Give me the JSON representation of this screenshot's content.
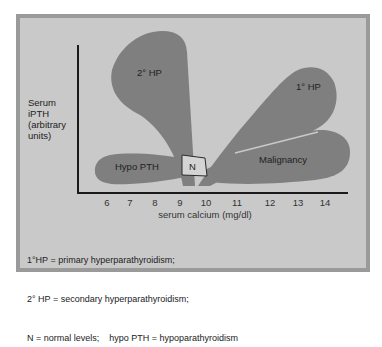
{
  "diagram": {
    "y_axis_label": [
      "Serum",
      "iPTH",
      "(arbitrary",
      "units)"
    ],
    "x_axis_label": "serum calcium (mg/dl)",
    "x_ticks": [
      "6",
      "7",
      "8",
      "9",
      "10",
      "11",
      "12",
      "13",
      "14"
    ],
    "regions": [
      {
        "id": "secondary_hp",
        "label": "2° HP"
      },
      {
        "id": "primary_hp",
        "label": "1° HP"
      },
      {
        "id": "malignancy",
        "label": "Malignancy"
      },
      {
        "id": "hypo_pth",
        "label": "Hypo PTH"
      },
      {
        "id": "normal",
        "label": "N"
      }
    ],
    "legend": [
      "1°HP = primary hyperparathyroidism;",
      "2° HP = secondary hyperparathyroidism;",
      "N = normal levels;    hypo PTH = hypoparathyroidism"
    ]
  },
  "colors": {
    "frame": "#9a9a9a",
    "panel": "#c9c9c9",
    "region_fill": "#7f7f7f",
    "normal_box": "#d4d4d4",
    "axis": "#1a1a1a"
  }
}
